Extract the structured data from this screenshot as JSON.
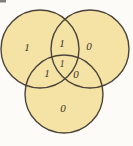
{
  "diagram": {
    "type": "venn",
    "colors": {
      "circle_fill": "#f5e2a5",
      "circle_stroke": "#4b443a",
      "label_text": "#3a352d",
      "background": "#fcfbf7"
    },
    "regions": {
      "a_only": {
        "name": "left-circle-only",
        "value": "1"
      },
      "ab": {
        "name": "left-right-intersection",
        "value": "1"
      },
      "b_only": {
        "name": "right-circle-only",
        "value": "0"
      },
      "abc": {
        "name": "center-triple-intersection",
        "value": "1"
      },
      "ac": {
        "name": "left-bottom-intersection",
        "value": "1"
      },
      "bc": {
        "name": "right-bottom-intersection",
        "value": "0"
      },
      "c_only": {
        "name": "bottom-circle-only",
        "value": "0"
      }
    }
  }
}
